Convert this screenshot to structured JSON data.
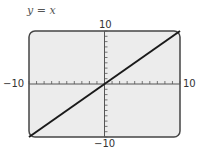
{
  "chart_data": {
    "type": "line",
    "title": "y = x",
    "xlabel": "",
    "ylabel": "",
    "xlim": [
      -10,
      10
    ],
    "ylim": [
      -10,
      10
    ],
    "x_tick_labels": {
      "min": "−10",
      "max": "10"
    },
    "y_tick_labels": {
      "min": "−10",
      "max": "10"
    },
    "x_ticks_step": 1,
    "y_ticks_step": 1,
    "grid": false,
    "legend": null,
    "series": [
      {
        "name": "y = x",
        "x": [
          -10,
          10
        ],
        "y": [
          -10,
          10
        ]
      }
    ]
  },
  "colors": {
    "screen_bg": "#ececec",
    "screen_border": "#444444",
    "line": "#1a1a1a",
    "axis": "#555555"
  }
}
